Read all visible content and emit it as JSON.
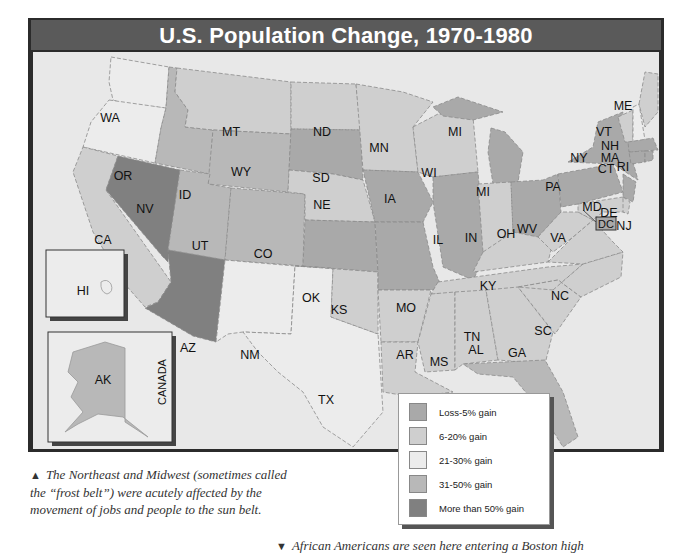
{
  "title": "U.S. Population Change, 1970-1980",
  "legend": [
    {
      "label": "Loss-5% gain",
      "color": "#a9a9a9"
    },
    {
      "label": "6-20% gain",
      "color": "#cfcfcf"
    },
    {
      "label": "21-30% gain",
      "color": "#ececec"
    },
    {
      "label": "31-50% gain",
      "color": "#b8b8b8"
    },
    {
      "label": "More than 50% gain",
      "color": "#808080"
    }
  ],
  "states": {
    "WA": "21-30% gain",
    "OR": "21-30% gain",
    "CA": "6-20% gain",
    "NV": "More than 50% gain",
    "ID": "31-50% gain",
    "MT": "6-20% gain",
    "WY": "31-50% gain",
    "UT": "31-50% gain",
    "CO": "31-50% gain",
    "AZ": "More than 50% gain",
    "NM": "21-30% gain",
    "TX": "21-30% gain",
    "ND": "6-20% gain",
    "SD": "Loss-5% gain",
    "NE": "6-20% gain",
    "KS": "Loss-5% gain",
    "OK": "6-20% gain",
    "MN": "6-20% gain",
    "IA": "Loss-5% gain",
    "MO": "Loss-5% gain",
    "AR": "6-20% gain",
    "LA": "6-20% gain",
    "WI": "6-20% gain",
    "IL": "Loss-5% gain",
    "MI": "Loss-5% gain",
    "IN": "6-20% gain",
    "OH": "Loss-5% gain",
    "KY": "6-20% gain",
    "TN": "6-20% gain",
    "MS": "6-20% gain",
    "AL": "6-20% gain",
    "GA": "6-20% gain",
    "FL": "31-50% gain",
    "SC": "6-20% gain",
    "NC": "6-20% gain",
    "VA": "6-20% gain",
    "WV": "6-20% gain",
    "PA": "Loss-5% gain",
    "NY": "Loss-5% gain",
    "NJ": "Loss-5% gain",
    "DE": "6-20% gain",
    "MD": "6-20% gain",
    "DC": "Loss-5% gain",
    "CT": "Loss-5% gain",
    "RI": "Loss-5% gain",
    "MA": "Loss-5% gain",
    "VT": "6-20% gain",
    "NH": "21-30% gain",
    "ME": "6-20% gain",
    "AK": "31-50% gain",
    "HI": "21-30% gain"
  },
  "labels": {
    "canada": "CANADA",
    "WA": "WA",
    "OR": "OR",
    "CA": "CA",
    "NV": "NV",
    "ID": "ID",
    "MT": "MT",
    "WY": "WY",
    "UT": "UT",
    "CO": "CO",
    "AZ": "AZ",
    "NM": "NM",
    "TX": "TX",
    "ND": "ND",
    "SD": "SD",
    "NE": "NE",
    "KS": "KS",
    "OK": "OK",
    "MN": "MN",
    "IA": "IA",
    "MO": "MO",
    "AR": "AR",
    "LA": "LA",
    "WI": "WI",
    "IL": "IL",
    "MI": "MI",
    "MI2": "MI",
    "IN": "IN",
    "OH": "OH",
    "KY": "KY",
    "TN": "TN",
    "MS": "MS",
    "AL": "AL",
    "GA": "GA",
    "FL": "FL",
    "SC": "SC",
    "NC": "NC",
    "VA": "VA",
    "WV": "WV",
    "PA": "PA",
    "NY": "NY",
    "NJ": "NJ",
    "DE": "DE",
    "MD": "MD",
    "DC": "DC",
    "CT": "CT",
    "RI": "RI",
    "MA": "MA",
    "VT": "VT",
    "NH": "NH",
    "ME": "ME",
    "AK": "AK",
    "HI": "HI"
  },
  "captions": {
    "left_marker": "▲",
    "left": "The Northeast and Midwest (sometimes called the “frost belt”) were acutely affected by the movement of jobs and people to the sun belt.",
    "right_marker": "▼",
    "right": "African Americans are seen here entering a Boston high"
  }
}
